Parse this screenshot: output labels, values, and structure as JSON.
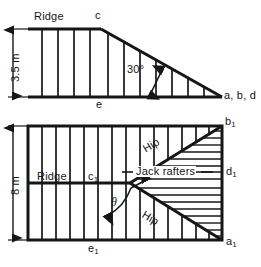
{
  "figure": {
    "type": "engineering-drawing",
    "elevation": {
      "name": "roof-elevation",
      "ridge_label": "Ridge",
      "apex_label": "c",
      "base_center_label": "e",
      "right_corner_label": "a, b, d",
      "angle_label": "30°",
      "height_label": "3.5 m",
      "rafter_count": 12
    },
    "plan": {
      "name": "roof-plan",
      "ridge_label": "Ridge",
      "ridge_end_label": "c",
      "ridge_end_sub": "1",
      "top_right_label": "b",
      "top_right_sub": "1",
      "right_mid_label": "d",
      "right_mid_sub": "1",
      "bottom_right_label": "a",
      "bottom_right_sub": "1",
      "bottom_left_label": "e",
      "bottom_left_sub": "1",
      "hip_upper_label": "Hip",
      "hip_lower_label": "Hip",
      "jack_rafters_label": "Jack rafters",
      "angle_label": "θ",
      "width_label": "8 m",
      "common_rafter_count": 13,
      "jack_rafter_count_upper": 8,
      "jack_rafter_count_lower": 8
    },
    "colors": {
      "line": "#161616",
      "background": "#ffffff",
      "text": "#161616"
    }
  }
}
